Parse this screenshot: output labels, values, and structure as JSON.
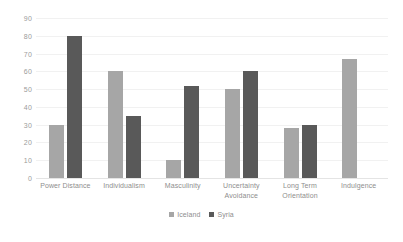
{
  "chart_data": {
    "type": "bar",
    "title": "",
    "subtitle": "",
    "xlabel": "",
    "ylabel": "",
    "ylim": [
      0,
      90
    ],
    "ytick_step": 10,
    "ytick_labels": [
      "90",
      "80",
      "70",
      "60",
      "50",
      "40",
      "30",
      "20",
      "10",
      "0"
    ],
    "grid": true,
    "legend_position": "bottom",
    "categories": [
      "Power Distance",
      "Individualism",
      "Masculinity",
      "Uncertainty Avoidance",
      "Long Term Orientation",
      "Indulgence"
    ],
    "series": [
      {
        "name": "Iceland",
        "color": "#a6a6a6",
        "values": [
          30,
          60,
          10,
          50,
          28,
          67
        ]
      },
      {
        "name": "Syria",
        "color": "#595959",
        "values": [
          80,
          35,
          52,
          60,
          30,
          null
        ]
      }
    ]
  },
  "colors": {
    "series_iceland": "#a6a6a6",
    "series_syria": "#595959",
    "gridline": "#f1f1f1",
    "axis_text": "#9b9b9b",
    "background": "#ffffff"
  }
}
